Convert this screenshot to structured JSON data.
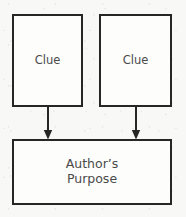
{
  "diagram": {
    "type": "flowchart",
    "background_color": "#f8f8f6",
    "border_color": "#262626",
    "text_color": "#4a4a4a",
    "node_fill": "#fdfdfc",
    "nodes": [
      {
        "id": "clue-left",
        "label": "Clue"
      },
      {
        "id": "clue-right",
        "label": "Clue"
      },
      {
        "id": "purpose",
        "label": "Author’s\nPurpose"
      }
    ],
    "connectors": [
      {
        "id": "arrow-left",
        "from": "clue-left",
        "to": "purpose",
        "style": "solid-arrow-down"
      },
      {
        "id": "arrow-right",
        "from": "clue-right",
        "to": "purpose",
        "style": "solid-arrow-down"
      }
    ]
  }
}
